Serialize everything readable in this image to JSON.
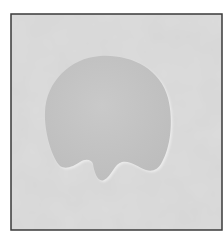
{
  "image": {
    "subject": "pale gray rounded blob shape with three drip-like lobes at the bottom, on a mottled light gray background inside a dark frame",
    "colors": {
      "page_background": "#ffffff",
      "frame_border": "#3a3a3a",
      "background": "#dcdcdc",
      "background_mottle": "#c9c9c9",
      "blob_fill": "#c4c4c4",
      "blob_edge_light": "#ececec",
      "blob_edge_dark": "#a9a9a9"
    }
  }
}
